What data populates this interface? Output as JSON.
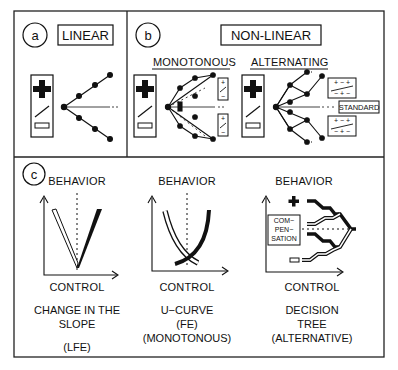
{
  "panels": {
    "a": {
      "letter": "a",
      "title": "LINEAR"
    },
    "b": {
      "letter": "b",
      "title": "NON-LINEAR",
      "sub_monotonous": "MONOTONOUS",
      "sub_alternating": "ALTERNATING",
      "standard_label": "STANDARD",
      "alt_box_top_row": "+ − +",
      "alt_box_bottom_row": "− + −",
      "mono_box_top": "+",
      "mono_box_bottom": "−"
    },
    "c": {
      "letter": "c",
      "graphs": [
        {
          "y_axis": "BEHAVIOR",
          "x_axis": "CONTROL",
          "caption_lines": [
            "CHANGE IN THE",
            "SLOPE",
            "(LFE)"
          ]
        },
        {
          "y_axis": "BEHAVIOR",
          "x_axis": "CONTROL",
          "caption_lines": [
            "U−CURVE",
            "(FE)",
            "(MONOTONOUS)"
          ]
        },
        {
          "y_axis": "BEHAVIOR",
          "x_axis": "CONTROL",
          "compensation_lines": [
            "COM−",
            "PEN−",
            "SATION"
          ],
          "caption_lines": [
            "DECISION",
            "TREE",
            "(ALTERNATIVE)"
          ]
        }
      ]
    }
  },
  "icons": {
    "plus": "plus-icon",
    "minus": "minus-icon",
    "slope": "slope-line-icon"
  }
}
